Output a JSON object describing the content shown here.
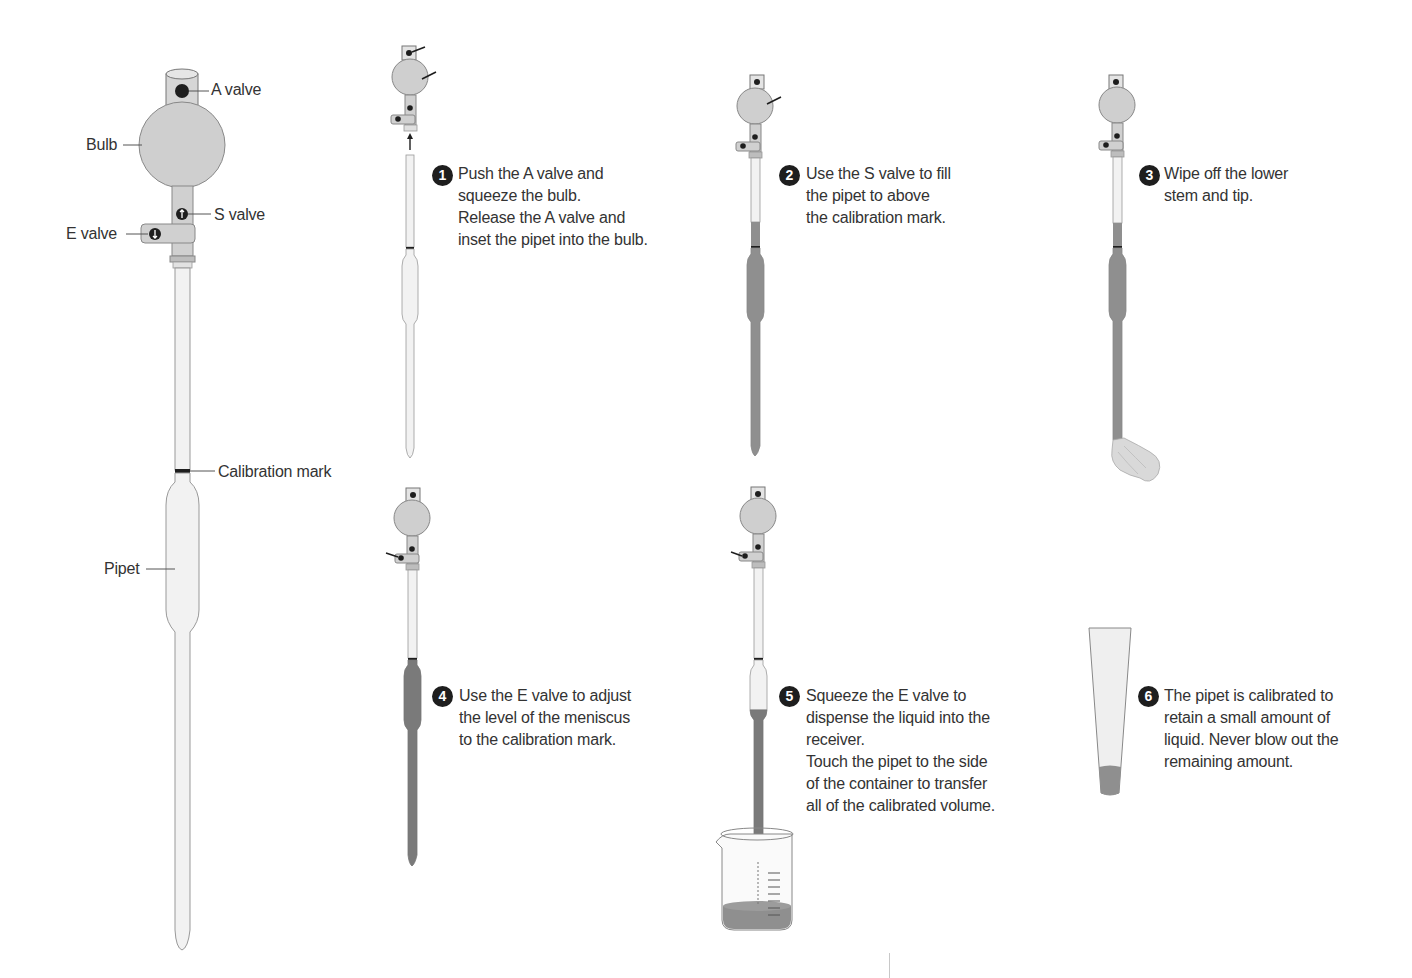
{
  "diagram": {
    "main_parts": {
      "a_valve": "A valve",
      "bulb": "Bulb",
      "s_valve": "S valve",
      "e_valve": "E valve",
      "calibration_mark": "Calibration mark",
      "pipet": "Pipet"
    },
    "steps": [
      {
        "number": "1",
        "lines": [
          "Push the A valve and",
          "squeeze the bulb.",
          "Release the A valve and",
          "inset the pipet into the bulb."
        ]
      },
      {
        "number": "2",
        "lines": [
          "Use the S valve to fill",
          "the pipet to above",
          "the calibration mark."
        ]
      },
      {
        "number": "3",
        "lines": [
          "Wipe off the lower",
          "stem and tip."
        ]
      },
      {
        "number": "4",
        "lines": [
          "Use the E valve to adjust",
          "the level of the meniscus",
          "to the calibration mark."
        ]
      },
      {
        "number": "5",
        "lines": [
          "Squeeze the E valve to",
          "dispense the liquid into the",
          "receiver.",
          "Touch the pipet to the side",
          "of the container to transfer",
          "all of the calibrated volume."
        ]
      },
      {
        "number": "6",
        "lines": [
          "The pipet is calibrated to",
          "retain a small amount of",
          "liquid. Never blow out the",
          "remaining amount."
        ]
      }
    ],
    "colors": {
      "glass": "#f2f2f2",
      "bulb": "#cfcfcf",
      "liquid": "#8f8f8f",
      "liquid_dark": "#7a7a7a",
      "outline": "#777777",
      "ink": "#1e1e1e",
      "text": "#333333"
    }
  }
}
